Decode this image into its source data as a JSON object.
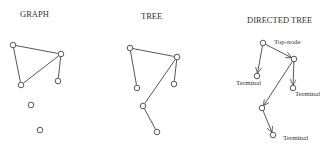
{
  "panels": [
    {
      "title": "GRAPH",
      "title_pos": [
        20,
        17
      ],
      "nodes": [
        [
          13,
          45
        ],
        [
          61,
          54
        ],
        [
          21,
          85
        ],
        [
          58,
          81
        ],
        [
          31,
          105
        ],
        [
          40,
          130
        ]
      ],
      "edges": [
        [
          0,
          1
        ],
        [
          0,
          2
        ],
        [
          1,
          2
        ],
        [
          1,
          3
        ]
      ],
      "directed": false,
      "labels": []
    },
    {
      "title": "TREE",
      "title_pos": [
        141,
        19
      ],
      "nodes": [
        [
          130,
          48
        ],
        [
          177,
          57
        ],
        [
          137,
          88
        ],
        [
          174,
          84
        ],
        [
          143,
          106
        ],
        [
          157,
          132
        ]
      ],
      "edges": [
        [
          0,
          1
        ],
        [
          0,
          2
        ],
        [
          1,
          3
        ],
        [
          1,
          4
        ],
        [
          4,
          5
        ]
      ],
      "directed": false,
      "labels": []
    },
    {
      "title": "DIRECTED TREE",
      "title_pos": [
        247,
        23
      ],
      "nodes": [
        [
          263,
          43
        ],
        [
          294,
          59
        ],
        [
          257,
          76
        ],
        [
          293,
          88
        ],
        [
          262,
          108
        ],
        [
          273,
          135
        ]
      ],
      "edges": [
        [
          0,
          1
        ],
        [
          0,
          2
        ],
        [
          1,
          3
        ],
        [
          1,
          4
        ],
        [
          4,
          5
        ]
      ],
      "directed": true,
      "labels": [
        {
          "text": "Top-node",
          "x": 274,
          "y": 44
        },
        {
          "text": "Terminal",
          "x": 236,
          "y": 85
        },
        {
          "text": "Terminal",
          "x": 295,
          "y": 96
        },
        {
          "text": "Terminal",
          "x": 283,
          "y": 140
        }
      ]
    }
  ]
}
